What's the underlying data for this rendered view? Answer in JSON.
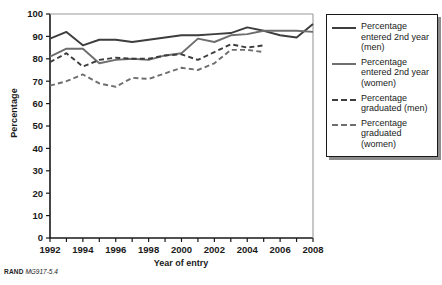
{
  "figure": {
    "source_note_prefix": "RAND",
    "source_note_id": "MG917-5.4"
  },
  "axes": {
    "xlabel": "Year of entry",
    "ylabel": "Percentage",
    "yticks": [
      "0",
      "10",
      "20",
      "30",
      "40",
      "50",
      "60",
      "70",
      "80",
      "90",
      "100"
    ],
    "xticks": [
      "1992",
      "1994",
      "1996",
      "1998",
      "2000",
      "2002",
      "2004",
      "2006",
      "2008"
    ]
  },
  "legend": {
    "items": [
      {
        "label": "Percentage entered 2nd year (men)",
        "style": "solid",
        "color": "#3d3d3d"
      },
      {
        "label": "Percentage entered 2nd year (women)",
        "style": "solid",
        "color": "#6e6e6e"
      },
      {
        "label": "Percentage graduated (men)",
        "style": "dashed",
        "color": "#3d3d3d"
      },
      {
        "label": "Percentage graduated (women)",
        "style": "dashed",
        "color": "#6e6e6e"
      }
    ]
  },
  "chart_data": {
    "type": "line",
    "title": "",
    "xlabel": "Year of entry",
    "ylabel": "Percentage",
    "xlim": [
      1992,
      2008
    ],
    "ylim": [
      0,
      100
    ],
    "yticks": [
      0,
      10,
      20,
      30,
      40,
      50,
      60,
      70,
      80,
      90,
      100
    ],
    "xticks": [
      1992,
      1994,
      1996,
      1998,
      2000,
      2002,
      2004,
      2006,
      2008
    ],
    "grid": false,
    "legend_position": "right",
    "x": [
      1992,
      1993,
      1994,
      1995,
      1996,
      1997,
      1998,
      1999,
      2000,
      2001,
      2002,
      2003,
      2004,
      2005,
      2006,
      2007,
      2008
    ],
    "series": [
      {
        "name": "Percentage entered 2nd year (men)",
        "style": "solid",
        "color": "#3d3d3d",
        "values": [
          89,
          92,
          86,
          88.5,
          88.5,
          87.5,
          88.5,
          89.5,
          90.5,
          90.5,
          91,
          91.5,
          94,
          92.5,
          90.5,
          89.5,
          95.5
        ]
      },
      {
        "name": "Percentage entered 2nd year (women)",
        "style": "solid",
        "color": "#6e6e6e",
        "values": [
          81,
          84.5,
          84.5,
          78,
          79.5,
          80,
          79.5,
          81.5,
          82.5,
          89,
          87.5,
          90.5,
          91,
          92.5,
          92.5,
          92.5,
          92
        ]
      },
      {
        "name": "Percentage graduated (men)",
        "style": "dashed",
        "color": "#3d3d3d",
        "values": [
          78.5,
          82.5,
          76.5,
          79.5,
          80.5,
          80,
          80,
          81.5,
          82,
          79.5,
          83,
          86.5,
          85,
          86,
          null,
          null,
          null
        ]
      },
      {
        "name": "Percentage graduated (women)",
        "style": "dashed",
        "color": "#6e6e6e",
        "values": [
          68,
          70,
          73,
          69,
          67.5,
          71.5,
          71,
          73.5,
          76,
          75,
          78,
          84,
          84,
          83,
          null,
          null,
          null
        ]
      }
    ]
  }
}
